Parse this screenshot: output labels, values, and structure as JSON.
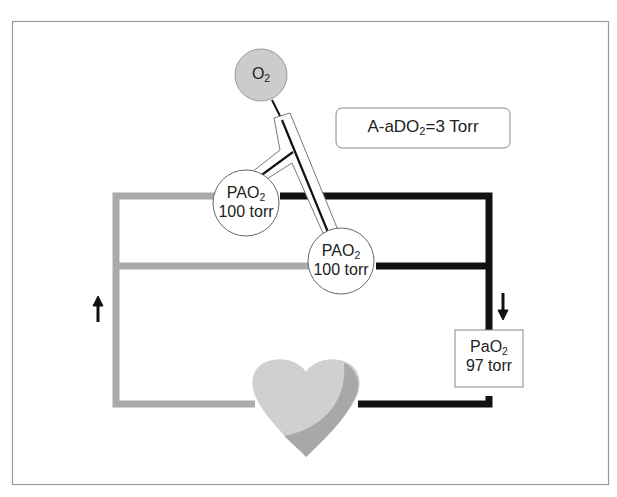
{
  "oxygen_source": {
    "label": "O",
    "subscript": "2"
  },
  "gradient_box": {
    "prefix": "A-aDO",
    "subscript": "2",
    "suffix": "=3 Torr"
  },
  "alveolus_1": {
    "line1": "PAO",
    "subscript": "2",
    "line2": "100 torr"
  },
  "alveolus_2": {
    "line1": "PAO",
    "subscript": "2",
    "line2": "100 torr"
  },
  "arterial_box": {
    "line1": "PaO",
    "subscript": "2",
    "line2": "97 torr"
  },
  "colors": {
    "venous_line": "#aaaaaa",
    "arterial_line": "#111111",
    "o2_circle": "#cccccc",
    "heart_light": "#d0d0d0",
    "heart_dark": "#a8a8a8",
    "frame": "#999999"
  },
  "flow_arrows": {
    "left": "up",
    "right": "down"
  }
}
